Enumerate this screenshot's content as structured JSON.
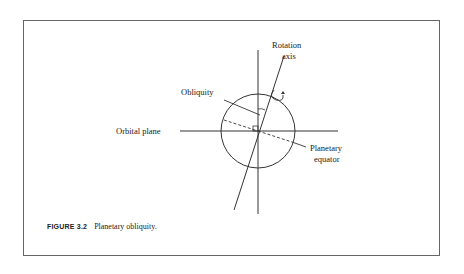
{
  "figure": {
    "number": "FIGURE 3.2",
    "caption": "Planetary obliquity."
  },
  "labels": {
    "rotation_axis_line1": "Rotation",
    "rotation_axis_line2": "axis",
    "obliquity": "Obliquity",
    "orbital_plane": "Orbital plane",
    "planetary_equator_line1": "Planetary",
    "planetary_equator_line2": "equator"
  },
  "colors": {
    "line": "#333333",
    "text": "#222222",
    "frame": "#666666"
  }
}
